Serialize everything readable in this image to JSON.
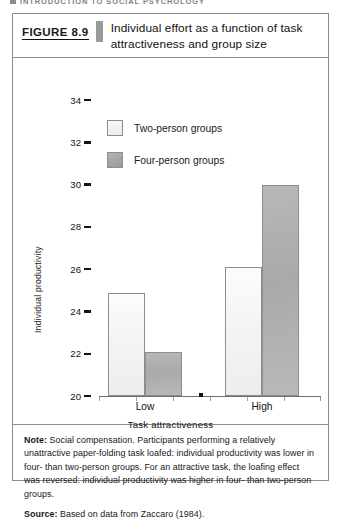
{
  "running_head": {
    "text": "INTRODUCTION TO SOCIAL PSYCHOLOGY",
    "marker_icon": "square-bullet-icon"
  },
  "figure": {
    "number_label": "FIGURE 8.9",
    "title": "Individual effort as a function of task attractiveness and group size",
    "note_lead": "Note:",
    "note_text": " Social compensation. Participants performing a relatively unattractive paper-folding task loafed: individual productivity was lower in four- than two-person groups. For an attractive task, the loafing effect was reversed: individual productivity was higher in four- than two-person groups.",
    "source_lead": "Source:",
    "source_text": " Based on data from Zaccaro (1984)."
  },
  "colors": {
    "two_person_fill": "#f4f4f4",
    "four_person_fill": "#a9a9a9",
    "bar_border": "#8d8d8d",
    "axis": "#6f6f6f",
    "text": "#171717",
    "caption_divider": "#9a9a9a"
  },
  "chart_data": {
    "type": "bar",
    "title": "Individual effort as a function of task attractiveness and group size",
    "xlabel": "Task attractiveness",
    "ylabel": "Individual productivity",
    "categories": [
      "Low",
      "High"
    ],
    "ylim": [
      20,
      34
    ],
    "yticks": [
      20,
      22,
      24,
      26,
      28,
      30,
      32,
      34
    ],
    "ytick_labels": [
      "20",
      "22",
      "24",
      "26",
      "28",
      "30",
      "32",
      "34"
    ],
    "grid": false,
    "legend_position": "upper-left-inside",
    "series": [
      {
        "name": "Two-person groups",
        "values": [
          24.9,
          26.1
        ],
        "fill": "#f4f4f4"
      },
      {
        "name": "Four-person groups",
        "values": [
          22.1,
          30.0
        ],
        "fill": "#a9a9a9"
      }
    ]
  }
}
